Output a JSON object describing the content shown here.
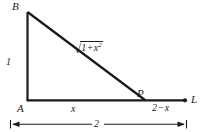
{
  "figure": {
    "type": "geometry-diagram",
    "canvas": {
      "width": 201,
      "height": 132,
      "background": "#ffffff"
    },
    "stroke_color": "#1a1a1a",
    "text_color": "#1a1a1a",
    "vertices": [
      {
        "name": "B",
        "label": "B",
        "x": 27,
        "y": 12
      },
      {
        "name": "A",
        "label": "A",
        "x": 27,
        "y": 100
      },
      {
        "name": "P",
        "label": "P",
        "x": 145,
        "y": 100
      },
      {
        "name": "L",
        "label": "L",
        "x": 185,
        "y": 100
      }
    ],
    "segments": [
      {
        "name": "vertical-leg-AB",
        "from": "A",
        "to": "B"
      },
      {
        "name": "hypotenuse-BP",
        "from": "B",
        "to": "P"
      },
      {
        "name": "base-ray-AL",
        "from": "A",
        "to": "L"
      }
    ],
    "labels": {
      "vertex_b": "B",
      "vertex_a": "A",
      "vertex_p": "P",
      "vertex_l": "L",
      "leg_length": "1",
      "hypotenuse_radical": "√",
      "hypotenuse_radicand_first": "1",
      "hypotenuse_operator": "+",
      "hypotenuse_radicand_var": "x",
      "hypotenuse_radicand_exponent": "2",
      "base_left_segment": "x",
      "base_right_number": "2",
      "base_right_operator": "−",
      "base_right_var": "x",
      "total_dimension": "2"
    }
  }
}
